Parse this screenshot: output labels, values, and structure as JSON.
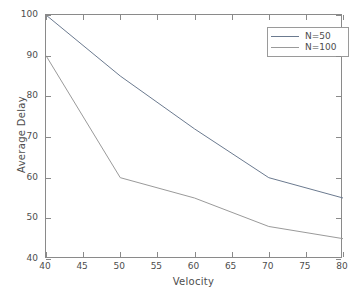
{
  "chart_data": {
    "type": "line",
    "title": "",
    "xlabel": "Velocity",
    "ylabel": "Average Delay",
    "xlim": [
      40,
      80
    ],
    "ylim": [
      40,
      100
    ],
    "xticks": [
      40,
      45,
      50,
      55,
      60,
      65,
      70,
      75,
      80
    ],
    "yticks": [
      40,
      50,
      60,
      70,
      80,
      90,
      100
    ],
    "xticklabels": [
      "40",
      "45",
      "50",
      "55",
      "60",
      "65",
      "70",
      "75",
      "80"
    ],
    "yticklabels": [
      "40",
      "50",
      "60",
      "70",
      "80",
      "90",
      "100"
    ],
    "grid": false,
    "legend_position": "upper right",
    "series": [
      {
        "name": "N=50",
        "color": "#6b7a8f",
        "x": [
          40,
          50,
          60,
          70,
          80
        ],
        "values": [
          100,
          85,
          72,
          60,
          55
        ]
      },
      {
        "name": "N=100",
        "color": "#9a9a9a",
        "x": [
          40,
          50,
          60,
          70,
          80
        ],
        "values": [
          90,
          60,
          55,
          48,
          45
        ]
      }
    ]
  },
  "legend": {
    "entries": [
      {
        "label": "N=50"
      },
      {
        "label": "N=100"
      }
    ]
  },
  "axes": {
    "x_title": "Velocity",
    "y_title": "Average Delay"
  },
  "style": {
    "axis_color": "#8a8a8a",
    "text_color": "#4d4d4d",
    "background": "#ffffff"
  }
}
